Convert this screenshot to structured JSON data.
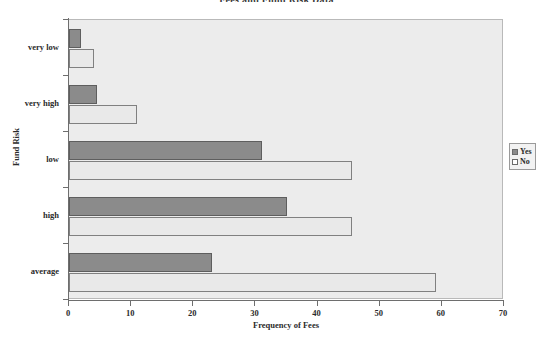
{
  "chart_data": {
    "type": "bar",
    "orientation": "horizontal",
    "title": "Fees and Fund Risk Data",
    "xlabel": "Frequency of Fees",
    "ylabel": "Fund Risk",
    "categories": [
      "very low",
      "very high",
      "low",
      "high",
      "average"
    ],
    "series": [
      {
        "name": "Yes",
        "color": "#8b8b8b",
        "values": [
          2,
          4.5,
          31,
          35,
          23
        ]
      },
      {
        "name": "No",
        "color": "#e9e9e9",
        "values": [
          4,
          11,
          45.5,
          45.5,
          59
        ]
      }
    ],
    "xlim": [
      0,
      70
    ],
    "xticks": [
      0,
      10,
      20,
      30,
      40,
      50,
      60,
      70
    ],
    "xtick_labels": [
      "0",
      "10",
      "20",
      "30",
      "40",
      "50",
      "60",
      "70"
    ],
    "grid": false,
    "legend_position": "right-outside",
    "plot_background": "#ececec"
  },
  "legend": {
    "entries": [
      {
        "label": "Yes"
      },
      {
        "label": "No"
      }
    ]
  }
}
